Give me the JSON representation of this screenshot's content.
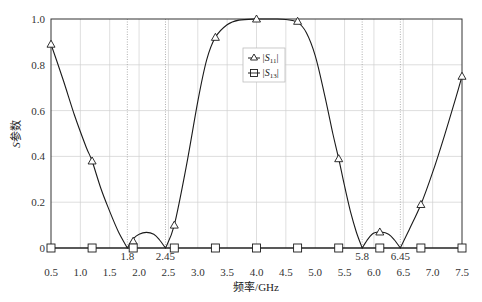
{
  "chart_data": {
    "type": "line",
    "title": "",
    "xlabel": "频率/GHz",
    "ylabel": "S参数",
    "xlim": [
      0.5,
      7.5
    ],
    "ylim": [
      0,
      1.0
    ],
    "grid": true,
    "x_ticks": [
      "0.5",
      "1.0",
      "1.5",
      "2.0",
      "2.5",
      "3.0",
      "3.5",
      "4.0",
      "4.5",
      "5.0",
      "5.5",
      "6.0",
      "6.5",
      "7.0",
      "7.5"
    ],
    "y_ticks": [
      "0",
      "0.2",
      "0.4",
      "0.6",
      "0.8",
      "1.0"
    ],
    "annotations": [
      {
        "x": 1.8,
        "label": "1.8"
      },
      {
        "x": 2.45,
        "label": "2.45"
      },
      {
        "x": 5.8,
        "label": "5.8"
      },
      {
        "x": 6.45,
        "label": "6.45"
      }
    ],
    "legend_position": "upper center",
    "series": [
      {
        "name": "|S11|",
        "marker": "triangle",
        "markers_x": [
          0.5,
          1.2,
          1.9,
          2.6,
          3.3,
          4.0,
          4.7,
          5.4,
          6.1,
          6.8,
          7.5
        ],
        "markers_y": [
          0.89,
          0.38,
          0.03,
          0.1,
          0.92,
          1.0,
          0.99,
          0.39,
          0.07,
          0.19,
          0.75
        ],
        "curve": [
          [
            0.5,
            0.89
          ],
          [
            0.7,
            0.74
          ],
          [
            0.9,
            0.58
          ],
          [
            1.1,
            0.44
          ],
          [
            1.2,
            0.38
          ],
          [
            1.35,
            0.26
          ],
          [
            1.5,
            0.16
          ],
          [
            1.65,
            0.07
          ],
          [
            1.8,
            0.0
          ],
          [
            1.9,
            0.04
          ],
          [
            2.0,
            0.06
          ],
          [
            2.125,
            0.068
          ],
          [
            2.25,
            0.06
          ],
          [
            2.35,
            0.035
          ],
          [
            2.45,
            0.0
          ],
          [
            2.6,
            0.1
          ],
          [
            2.8,
            0.35
          ],
          [
            3.0,
            0.64
          ],
          [
            3.15,
            0.82
          ],
          [
            3.3,
            0.92
          ],
          [
            3.5,
            0.975
          ],
          [
            3.7,
            0.995
          ],
          [
            4.0,
            1.0
          ],
          [
            4.3,
            1.0
          ],
          [
            4.5,
            0.998
          ],
          [
            4.7,
            0.985
          ],
          [
            4.85,
            0.94
          ],
          [
            5.0,
            0.84
          ],
          [
            5.15,
            0.68
          ],
          [
            5.3,
            0.5
          ],
          [
            5.4,
            0.39
          ],
          [
            5.5,
            0.27
          ],
          [
            5.6,
            0.16
          ],
          [
            5.7,
            0.07
          ],
          [
            5.8,
            0.0
          ],
          [
            5.9,
            0.04
          ],
          [
            6.0,
            0.065
          ],
          [
            6.125,
            0.07
          ],
          [
            6.25,
            0.06
          ],
          [
            6.35,
            0.035
          ],
          [
            6.45,
            0.0
          ],
          [
            6.6,
            0.08
          ],
          [
            6.8,
            0.19
          ],
          [
            7.0,
            0.33
          ],
          [
            7.2,
            0.49
          ],
          [
            7.4,
            0.66
          ],
          [
            7.5,
            0.75
          ]
        ]
      },
      {
        "name": "|S13|",
        "marker": "square",
        "markers_x": [
          0.5,
          1.2,
          1.9,
          2.6,
          3.3,
          4.0,
          4.7,
          5.4,
          6.1,
          6.8,
          7.5
        ],
        "markers_y": [
          0,
          0,
          0,
          0,
          0,
          0,
          0,
          0,
          0,
          0,
          0
        ]
      }
    ]
  },
  "legend": {
    "s11_label_base": "|S",
    "s11_sub": "11",
    "s13_label_base": "|S",
    "s13_sub": "13",
    "bar": "|"
  },
  "axes": {
    "xlabel": "频率/GHz",
    "ylabel_s": "S",
    "ylabel_rest": "参数"
  },
  "colors": {
    "line": "#1a1a1a",
    "grid": "#d0d0d0",
    "dotted": "#9a9a9a",
    "frame": "#333333"
  }
}
